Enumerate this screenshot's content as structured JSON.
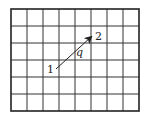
{
  "diagram": {
    "type": "grid-with-vector",
    "grid": {
      "columns": 8,
      "rows": 6,
      "x0": 11,
      "y0": 9,
      "cell_width": 16,
      "cell_height": 17,
      "line_color": "#333333",
      "border_color": "#222222"
    },
    "vector": {
      "from": {
        "x": 56,
        "y": 69
      },
      "to": {
        "x": 91,
        "y": 37
      },
      "color": "#222222"
    },
    "labels": {
      "start": "1",
      "end": "2",
      "angle": "q"
    }
  }
}
